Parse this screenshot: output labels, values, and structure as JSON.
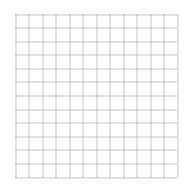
{
  "grid": {
    "columns": 12,
    "rows": 12,
    "left": 15.5,
    "top": 14.5,
    "right": 177.5,
    "bottom": 177.5,
    "line_color": "#8a8a8a",
    "background": "#ffffff",
    "dash": "1 1"
  }
}
